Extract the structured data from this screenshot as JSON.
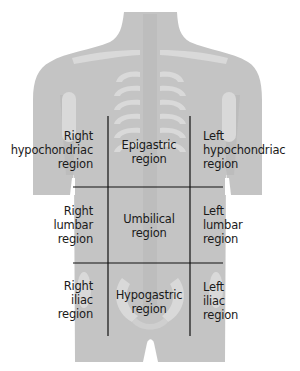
{
  "diagram": {
    "colors": {
      "background": "#ffffff",
      "body_fill": "#c4c4c4",
      "bone_fill": "#d8d8d8",
      "bone_shadow": "#b3b3b3",
      "grid_line": "#111111",
      "text": "#1a1a1a"
    },
    "regions": [
      {
        "id": "right-hypochondriac",
        "lines": [
          "Right",
          "hypochondriac",
          "region"
        ]
      },
      {
        "id": "epigastric",
        "lines": [
          "Epigastric",
          "region"
        ]
      },
      {
        "id": "left-hypochondriac",
        "lines": [
          "Left",
          "hypochondriac",
          "region"
        ]
      },
      {
        "id": "right-lumbar",
        "lines": [
          "Right",
          "lumbar",
          "region"
        ]
      },
      {
        "id": "umbilical",
        "lines": [
          "Umbilical",
          "region"
        ]
      },
      {
        "id": "left-lumbar",
        "lines": [
          "Left",
          "lumbar",
          "region"
        ]
      },
      {
        "id": "right-iliac",
        "lines": [
          "Right",
          "iliac",
          "region"
        ]
      },
      {
        "id": "hypogastric",
        "lines": [
          "Hypogastric",
          "region"
        ]
      },
      {
        "id": "left-iliac",
        "lines": [
          "Left",
          "iliac",
          "region"
        ]
      }
    ]
  }
}
